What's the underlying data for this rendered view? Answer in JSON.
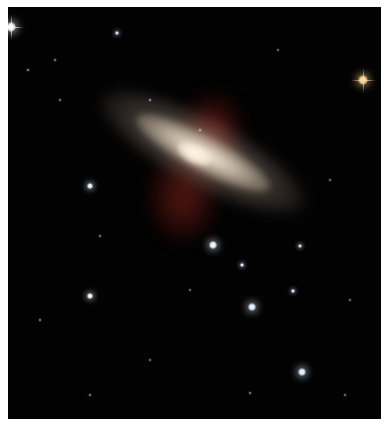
{
  "image": {
    "subject": "Edge-on starburst galaxy with red outflow filaments against a star field",
    "background_color": "#020202",
    "border_color": "#ffffff",
    "galaxy": {
      "disk_color": "#e6d6c0",
      "core_color": "#fffaf0",
      "outflow_color": "#a0281e",
      "orientation_deg": 28
    },
    "stars": [
      {
        "x": 11,
        "y": 27,
        "r": 5,
        "color": "#ffffff",
        "spikes": true
      },
      {
        "x": 117,
        "y": 33,
        "r": 2,
        "color": "#cfe0ff"
      },
      {
        "x": 363,
        "y": 80,
        "r": 5,
        "color": "#ffd79a",
        "spikes": true
      },
      {
        "x": 90,
        "y": 186,
        "r": 3,
        "color": "#e8f0ff"
      },
      {
        "x": 213,
        "y": 245,
        "r": 4,
        "color": "#f0f6ff"
      },
      {
        "x": 242,
        "y": 265,
        "r": 2,
        "color": "#dfe8ff"
      },
      {
        "x": 252,
        "y": 307,
        "r": 4,
        "color": "#e6f2ff"
      },
      {
        "x": 90,
        "y": 296,
        "r": 3,
        "color": "#f0f4ff"
      },
      {
        "x": 302,
        "y": 372,
        "r": 4,
        "color": "#dff0ff"
      },
      {
        "x": 293,
        "y": 291,
        "r": 2,
        "color": "#d8e4ff"
      },
      {
        "x": 28,
        "y": 70,
        "r": 1,
        "color": "#bbbbbb"
      },
      {
        "x": 55,
        "y": 60,
        "r": 1,
        "color": "#aaaaaa"
      },
      {
        "x": 200,
        "y": 130,
        "r": 1,
        "color": "#cccccc"
      },
      {
        "x": 300,
        "y": 246,
        "r": 2,
        "color": "#cfd8e8"
      },
      {
        "x": 40,
        "y": 320,
        "r": 1,
        "color": "#aaaaaa"
      },
      {
        "x": 150,
        "y": 360,
        "r": 1,
        "color": "#999999"
      },
      {
        "x": 250,
        "y": 393,
        "r": 1,
        "color": "#aaaaaa"
      },
      {
        "x": 345,
        "y": 395,
        "r": 1,
        "color": "#999999"
      },
      {
        "x": 60,
        "y": 100,
        "r": 1,
        "color": "#aaaaaa"
      },
      {
        "x": 330,
        "y": 180,
        "r": 1,
        "color": "#999999"
      },
      {
        "x": 150,
        "y": 100,
        "r": 1,
        "color": "#bbbbbb"
      },
      {
        "x": 278,
        "y": 50,
        "r": 1,
        "color": "#999999"
      },
      {
        "x": 100,
        "y": 236,
        "r": 1,
        "color": "#aaaaaa"
      },
      {
        "x": 190,
        "y": 290,
        "r": 1,
        "color": "#999999"
      },
      {
        "x": 90,
        "y": 395,
        "r": 1,
        "color": "#aaaaaa"
      },
      {
        "x": 350,
        "y": 300,
        "r": 1,
        "color": "#999999"
      }
    ]
  }
}
